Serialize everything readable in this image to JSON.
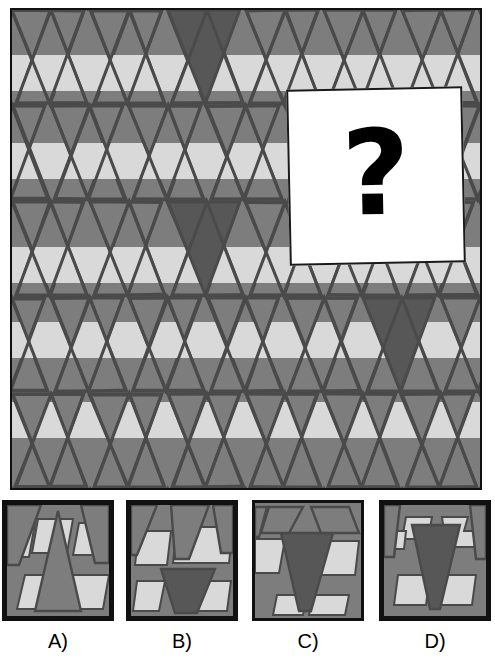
{
  "puzzle": {
    "type": "visual-pattern-completion",
    "prompt_symbol": "?",
    "main_panel": {
      "name": "pattern-grid",
      "background_color": "#808080",
      "border_color": "#111111",
      "colors": {
        "medium_gray": "#7d7d7d",
        "light_gray": "#d9d9d9",
        "dark_gray": "#575757",
        "outline": "#4a4a4a"
      },
      "description": "Tessellation of downward-pointing triangles crossed by horizontal light-gray bands",
      "grid": {
        "columns": 6,
        "rows": 5,
        "cell_width": 78,
        "cell_height": 96
      },
      "band_rows_y": [
        53,
        140,
        245,
        320,
        400
      ],
      "accent_triangles": [
        {
          "column": 2,
          "row": 0
        },
        {
          "column": 2,
          "row": 2
        },
        {
          "column": 4,
          "row": 3
        }
      ]
    },
    "question_card": {
      "name": "missing-piece-card",
      "label": "?",
      "background_color": "#ffffff",
      "border_color": "#1a1a1a",
      "x": 288,
      "y": 88,
      "width": 176,
      "height": 176,
      "rotation_deg": -1.2
    },
    "answers": [
      {
        "id": "A",
        "label": "A)",
        "name": "answer-option-a",
        "selected": false,
        "motif": "upward-V-apex-with-two-light-parallelogram-bands"
      },
      {
        "id": "B",
        "label": "B)",
        "name": "answer-option-b",
        "selected": false,
        "motif": "light-band-upper-with-dark-inverted-triangle-lower"
      },
      {
        "id": "C",
        "label": "C)",
        "name": "answer-option-c",
        "selected": false,
        "motif": "large-dark-inverted-triangle-centered-on-light-band"
      },
      {
        "id": "D",
        "label": "D)",
        "name": "answer-option-d",
        "selected": false,
        "motif": "dark-inverted-triangle-flanked-by-light-steps"
      }
    ]
  }
}
